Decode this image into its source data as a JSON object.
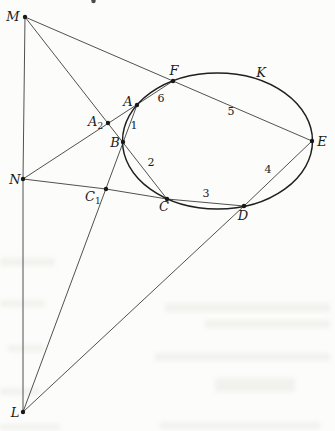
{
  "figure": {
    "background": "#fcfcfa",
    "ink_color": "#1b1b1b",
    "line_color": "#3d3d3d",
    "conic": {
      "label": "K"
    },
    "points": {
      "M": {
        "label": "M",
        "x": 25,
        "y": 17
      },
      "N": {
        "label": "N",
        "x": 23,
        "y": 179
      },
      "L": {
        "label": "L",
        "x": 23,
        "y": 412
      },
      "A": {
        "label": "A",
        "x": 137,
        "y": 105
      },
      "B": {
        "label": "B",
        "x": 123,
        "y": 142
      },
      "C": {
        "label": "C",
        "x": 167,
        "y": 199
      },
      "D": {
        "label": "D",
        "x": 244,
        "y": 206
      },
      "E": {
        "label": "E",
        "x": 312,
        "y": 141
      },
      "F": {
        "label": "F",
        "x": 173,
        "y": 81
      },
      "A2": {
        "base": "A",
        "sub": "2",
        "x": 108,
        "y": 123
      },
      "C1": {
        "base": "C",
        "sub": "1",
        "x": 106,
        "y": 189
      }
    },
    "side_numbers": {
      "n1": "1",
      "n2": "2",
      "n3": "3",
      "n4": "4",
      "n5": "5",
      "n6": "6"
    }
  }
}
